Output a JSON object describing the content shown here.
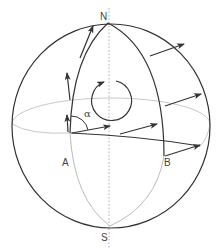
{
  "diagram": {
    "labels": {
      "north": "N",
      "south": "S",
      "point_a": "A",
      "point_b": "B",
      "angle": "α"
    },
    "colors": {
      "stroke": "#333333",
      "hidden": "#bbbbbb",
      "axis": "#999999",
      "text": "#444444"
    }
  }
}
